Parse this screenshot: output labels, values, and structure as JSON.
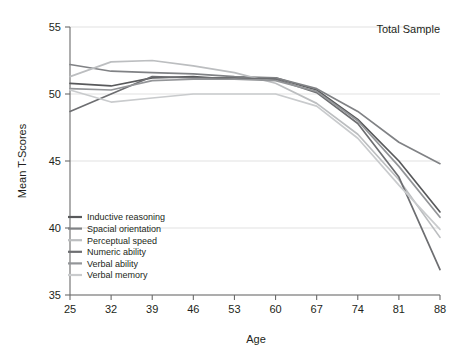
{
  "panel": {
    "title": "Total Sample"
  },
  "chart_data": {
    "type": "line",
    "title": "Total Sample",
    "xlabel": "Age",
    "ylabel": "Mean T-Scores",
    "x": [
      25,
      32,
      39,
      46,
      53,
      60,
      67,
      74,
      81,
      88
    ],
    "categories": [
      "25",
      "32",
      "39",
      "46",
      "53",
      "60",
      "67",
      "74",
      "81",
      "88"
    ],
    "xlim": [
      25,
      88
    ],
    "ylim": [
      35,
      55
    ],
    "yticks": [
      35,
      40,
      45,
      50,
      55
    ],
    "xticks": [
      25,
      32,
      39,
      46,
      53,
      60,
      67,
      74,
      81,
      88
    ],
    "grid": "horizontal",
    "legend_position": "lower-left-inside",
    "series": [
      {
        "name": "Inductive reasoning",
        "color": "#58595b",
        "values": [
          50.8,
          50.6,
          51.2,
          51.3,
          51.1,
          51.2,
          50.3,
          48.1,
          45.0,
          41.2
        ]
      },
      {
        "name": "Spacial orientation",
        "color": "#808285",
        "values": [
          52.2,
          51.7,
          51.6,
          51.5,
          51.3,
          51.2,
          50.4,
          48.7,
          46.4,
          44.8
        ]
      },
      {
        "name": "Perceptual speed",
        "color": "#bcbec0",
        "values": [
          51.3,
          52.4,
          52.5,
          52.1,
          51.6,
          50.8,
          49.3,
          47.0,
          43.6,
          39.3
        ]
      },
      {
        "name": "Numeric ability",
        "color": "#6d6e71",
        "values": [
          48.7,
          50.0,
          51.3,
          51.2,
          51.2,
          51.1,
          50.1,
          47.8,
          43.8,
          36.9
        ]
      },
      {
        "name": "Verbal ability",
        "color": "#939598",
        "values": [
          50.4,
          50.3,
          51.0,
          51.1,
          51.1,
          51.0,
          50.2,
          48.0,
          44.6,
          40.8
        ]
      },
      {
        "name": "Verbal memory",
        "color": "#c9cbcd",
        "values": [
          50.3,
          49.4,
          49.7,
          50.0,
          50.0,
          50.0,
          49.1,
          46.7,
          43.2,
          39.9
        ]
      }
    ]
  },
  "axes": {
    "y_label": "Mean T-Scores",
    "x_label": "Age",
    "y_tick_labels": [
      "55",
      "50",
      "45",
      "40",
      "35"
    ],
    "x_tick_labels": [
      "25",
      "32",
      "39",
      "46",
      "53",
      "60",
      "67",
      "74",
      "81",
      "88"
    ]
  },
  "legend": {
    "items": [
      {
        "label": "Inductive reasoning",
        "color": "#58595b"
      },
      {
        "label": "Spacial orientation",
        "color": "#808285"
      },
      {
        "label": "Perceptual speed",
        "color": "#bcbec0"
      },
      {
        "label": "Numeric ability",
        "color": "#6d6e71"
      },
      {
        "label": "Verbal ability",
        "color": "#939598"
      },
      {
        "label": "Verbal memory",
        "color": "#c9cbcd"
      }
    ]
  },
  "colors": {
    "grid": "#d9d9d9",
    "axis": "#6b6b6b",
    "text": "#231f20",
    "background": "#ffffff"
  }
}
